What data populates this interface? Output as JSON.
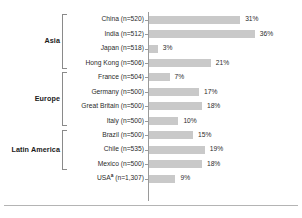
{
  "chart_data": {
    "type": "bar",
    "orientation": "horizontal",
    "title": "",
    "xlabel": "",
    "ylabel": "",
    "xlim": [
      0,
      40
    ],
    "grid": false,
    "legend": false,
    "value_suffix": "%",
    "categories": [
      "China (n=520)",
      "India (n=512)",
      "Japan (n=518)",
      "Hong Kong (n=506)",
      "France (n=504)",
      "Germany (n=500)",
      "Great Britain (n=500)",
      "Italy (n=500)",
      "Brazil (n=500)",
      "Chile (n=535)",
      "Mexico (n=500)",
      "USA (n=1,307)"
    ],
    "values": [
      31,
      36,
      3,
      21,
      7,
      17,
      18,
      10,
      15,
      19,
      18,
      9
    ],
    "value_labels": [
      "31%",
      "36%",
      "3%",
      "21%",
      "7%",
      "17%",
      "18%",
      "10%",
      "15%",
      "19%",
      "18%",
      "9%"
    ],
    "bar_color": "#c9c9c9"
  },
  "rows": [
    {
      "label": "China (n=520)",
      "label_main": "China (n=520)",
      "sup": "",
      "value": 31,
      "value_label": "31%"
    },
    {
      "label": "India (n=512)",
      "label_main": "India (n=512)",
      "sup": "",
      "value": 36,
      "value_label": "36%"
    },
    {
      "label": "Japan (n=518)",
      "label_main": "Japan (n=518)",
      "sup": "",
      "value": 3,
      "value_label": "3%"
    },
    {
      "label": "Hong Kong (n=506)",
      "label_main": "Hong Kong (n=506)",
      "sup": "",
      "value": 21,
      "value_label": "21%"
    },
    {
      "label": "France (n=504)",
      "label_main": "France (n=504)",
      "sup": "",
      "value": 7,
      "value_label": "7%"
    },
    {
      "label": "Germany (n=500)",
      "label_main": "Germany (n=500)",
      "sup": "",
      "value": 17,
      "value_label": "17%"
    },
    {
      "label": "Great Britain (n=500)",
      "label_main": "Great Britain (n=500)",
      "sup": "",
      "value": 18,
      "value_label": "18%"
    },
    {
      "label": "Italy (n=500)",
      "label_main": "Italy (n=500)",
      "sup": "",
      "value": 10,
      "value_label": "10%"
    },
    {
      "label": "Brazil (n=500)",
      "label_main": "Brazil (n=500)",
      "sup": "",
      "value": 15,
      "value_label": "15%"
    },
    {
      "label": "Chile (n=535)",
      "label_main": "Chile (n=535)",
      "sup": "",
      "value": 19,
      "value_label": "19%"
    },
    {
      "label": "Mexico (n=500)",
      "label_main": "Mexico (n=500)",
      "sup": "",
      "value": 18,
      "value_label": "18%"
    },
    {
      "label": "USA (n=1,307)",
      "label_main": "USA",
      "sup": "a",
      "label_tail": " (n=1,307)",
      "value": 9,
      "value_label": "9%"
    }
  ],
  "groups": [
    {
      "name": "Asia",
      "first_row": 0,
      "last_row": 3
    },
    {
      "name": "Europe",
      "first_row": 4,
      "last_row": 7
    },
    {
      "name": "Latin America",
      "first_row": 8,
      "last_row": 10
    }
  ],
  "colors": {
    "bar": "#c9c9c9",
    "text": "#2b2b2b",
    "group_text": "#1a1a1a",
    "axis": "#9a9a9a",
    "bracket": "#8a8a8a",
    "rule": "#b4b4b4",
    "background": "#ffffff"
  }
}
